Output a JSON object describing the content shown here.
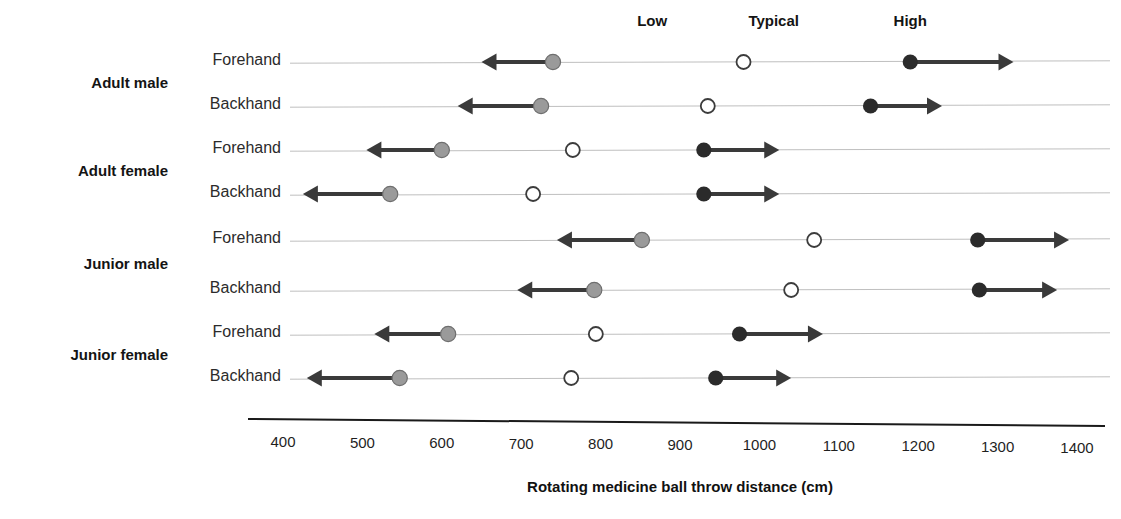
{
  "chart_data": {
    "type": "scatter",
    "title": "",
    "xlabel": "Rotating medicine ball throw distance (cm)",
    "ylabel": "",
    "xlim": [
      400,
      1400
    ],
    "xticks": [
      400,
      500,
      600,
      700,
      800,
      900,
      1000,
      1100,
      1200,
      1300,
      1400
    ],
    "xtick_labels": [
      "400",
      "500",
      "600",
      "700",
      "800",
      "900",
      "1000",
      "1100",
      "1200",
      "1300",
      "1400"
    ],
    "grid": false,
    "legend_position": "top",
    "column_headers": [
      "Low",
      "Typical",
      "High"
    ],
    "groups": [
      "Adult male",
      "Adult female",
      "Junior male",
      "Junior female"
    ],
    "row_labels": [
      "Forehand",
      "Backhand"
    ],
    "marker_styles": {
      "Low": "filled-gray-circle-with-left-arrow",
      "Typical": "open-circle",
      "High": "filled-black-circle-with-right-arrow"
    },
    "series": [
      {
        "group": "Adult male",
        "stroke": "Forehand",
        "low": 740,
        "typical": 980,
        "high": 1190,
        "low_arrow_to": 650,
        "high_arrow_to": 1320
      },
      {
        "group": "Adult male",
        "stroke": "Backhand",
        "low": 725,
        "typical": 935,
        "high": 1140,
        "low_arrow_to": 620,
        "high_arrow_to": 1230
      },
      {
        "group": "Adult female",
        "stroke": "Forehand",
        "low": 600,
        "typical": 765,
        "high": 930,
        "low_arrow_to": 505,
        "high_arrow_to": 1025
      },
      {
        "group": "Adult female",
        "stroke": "Backhand",
        "low": 535,
        "typical": 715,
        "high": 930,
        "low_arrow_to": 425,
        "high_arrow_to": 1025
      },
      {
        "group": "Junior male",
        "stroke": "Forehand",
        "low": 852,
        "typical": 1069,
        "high": 1275,
        "low_arrow_to": 745,
        "high_arrow_to": 1390
      },
      {
        "group": "Junior male",
        "stroke": "Backhand",
        "low": 792,
        "typical": 1040,
        "high": 1277,
        "low_arrow_to": 695,
        "high_arrow_to": 1375
      },
      {
        "group": "Junior female",
        "stroke": "Forehand",
        "low": 608,
        "typical": 794,
        "high": 975,
        "low_arrow_to": 515,
        "high_arrow_to": 1080
      },
      {
        "group": "Junior female",
        "stroke": "Backhand",
        "low": 547,
        "typical": 763,
        "high": 945,
        "low_arrow_to": 430,
        "high_arrow_to": 1040
      }
    ],
    "colors": {
      "low_marker": "#9a9a9a",
      "typical_marker": "#ffffff",
      "typical_marker_edge": "#3c3c3c",
      "high_marker": "#2b2b2b",
      "arrow": "#3a3a3a",
      "baseline": "#7f7f7f",
      "axis": "#1a1a1a"
    }
  },
  "headers": {
    "low": "Low",
    "typical": "Typical",
    "high": "High"
  },
  "axis": {
    "title": "Rotating medicine ball throw distance (cm)",
    "ticks": [
      "400",
      "500",
      "600",
      "700",
      "800",
      "900",
      "1000",
      "1100",
      "1200",
      "1300",
      "1400"
    ]
  },
  "groups": [
    {
      "name": "Adult male",
      "rows": [
        "Forehand",
        "Backhand"
      ]
    },
    {
      "name": "Adult female",
      "rows": [
        "Forehand",
        "Backhand"
      ]
    },
    {
      "name": "Junior male",
      "rows": [
        "Forehand",
        "Backhand"
      ]
    },
    {
      "name": "Junior female",
      "rows": [
        "Forehand",
        "Backhand"
      ]
    }
  ]
}
